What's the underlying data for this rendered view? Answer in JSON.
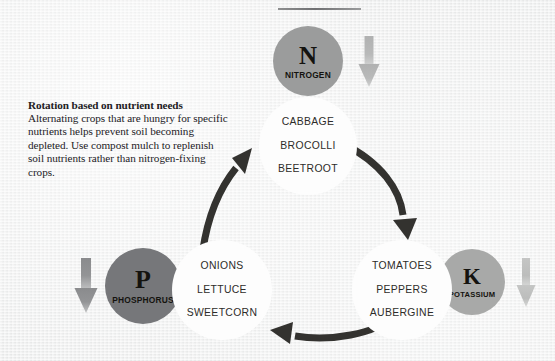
{
  "background_color": "#eceded",
  "note": {
    "title": "Rotation based on nutrient needs",
    "body": "Alternating crops that are hungry for specific nutrients helps prevent soil becoming depleted. Use compost mulch to replenish soil nutrients rather than nitrogen-fixing crops."
  },
  "nutrients": [
    {
      "id": "nitrogen",
      "letter": "N",
      "label": "NITROGEN",
      "color": "#9b9c9c",
      "arrow_color": "#b4b5b5"
    },
    {
      "id": "phosphorus",
      "letter": "P",
      "label": "PHOSPHORUS",
      "color": "#76777a",
      "arrow_color": "#8d8e90"
    },
    {
      "id": "potassium",
      "letter": "K",
      "label": "POTASSIUM",
      "color": "#a8a9a8",
      "arrow_color": "#bdbebd"
    }
  ],
  "crop_groups": [
    {
      "id": "top",
      "crops": [
        "CABBAGE",
        "BROCOLLI",
        "BEETROOT"
      ]
    },
    {
      "id": "left",
      "crops": [
        "ONIONS",
        "LETTUCE",
        "SWEETCORN"
      ]
    },
    {
      "id": "right",
      "crops": [
        "TOMATOES",
        "PEPPERS",
        "AUBERGINE"
      ]
    }
  ],
  "cycle_arrow_color": "#33322f"
}
